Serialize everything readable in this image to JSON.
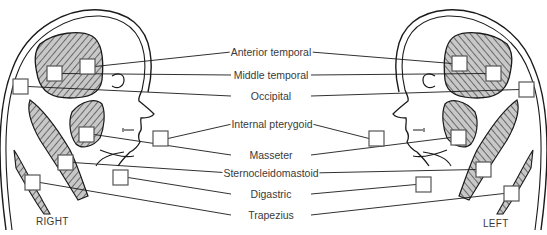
{
  "colors": {
    "ink": "#1a1a1a",
    "muscle_fill": "#c8c8c8",
    "box_stroke": "#555555",
    "text": "#3a3a3a"
  },
  "side_labels": {
    "right": "RIGHT",
    "left": "LEFT"
  },
  "muscle_labels": [
    {
      "id": "anterior-temporal",
      "text": "Anterior temporal",
      "x": 271,
      "y": 52
    },
    {
      "id": "middle-temporal",
      "text": "Middle temporal",
      "x": 271,
      "y": 75
    },
    {
      "id": "occipital",
      "text": "Occipital",
      "x": 271,
      "y": 96
    },
    {
      "id": "internal-pterygoid",
      "text": "Internal pterygoid",
      "x": 272,
      "y": 124
    },
    {
      "id": "masseter",
      "text": "Masseter",
      "x": 271,
      "y": 155
    },
    {
      "id": "sternocleidomastoid",
      "text": "Sternocleidomastoid",
      "x": 271,
      "y": 173
    },
    {
      "id": "digastric",
      "text": "Digastric",
      "x": 271,
      "y": 194
    },
    {
      "id": "trapezius",
      "text": "Trapezius",
      "x": 271,
      "y": 215
    }
  ],
  "right_boxes": [
    {
      "muscle": "anterior-temporal",
      "x": 80,
      "y": 59
    },
    {
      "muscle": "middle-temporal",
      "x": 47,
      "y": 66
    },
    {
      "muscle": "occipital",
      "x": 13,
      "y": 79
    },
    {
      "muscle": "internal-pterygoid",
      "x": 153,
      "y": 131
    },
    {
      "muscle": "masseter",
      "x": 79,
      "y": 127
    },
    {
      "muscle": "sternocleidomastoid",
      "x": 58,
      "y": 155
    },
    {
      "muscle": "digastric",
      "x": 113,
      "y": 170
    },
    {
      "muscle": "trapezius",
      "x": 25,
      "y": 175
    }
  ],
  "left_boxes": [
    {
      "muscle": "anterior-temporal",
      "x": 452,
      "y": 56
    },
    {
      "muscle": "middle-temporal",
      "x": 486,
      "y": 66
    },
    {
      "muscle": "occipital",
      "x": 519,
      "y": 82
    },
    {
      "muscle": "internal-pterygoid",
      "x": 369,
      "y": 131
    },
    {
      "muscle": "masseter",
      "x": 451,
      "y": 130
    },
    {
      "muscle": "sternocleidomastoid",
      "x": 476,
      "y": 162
    },
    {
      "muscle": "digastric",
      "x": 416,
      "y": 177
    },
    {
      "muscle": "trapezius",
      "x": 504,
      "y": 186
    }
  ]
}
